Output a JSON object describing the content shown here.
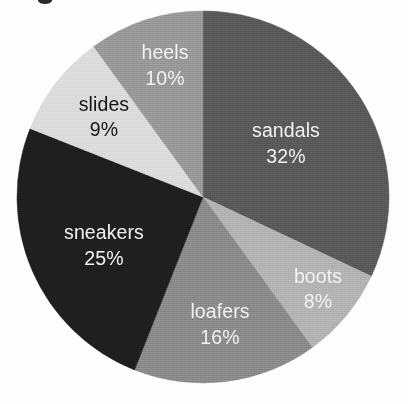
{
  "chart_data": {
    "type": "pie",
    "title": "",
    "subtitle": "",
    "xlabel": "",
    "ylabel": "",
    "legend_position": "none",
    "grid": false,
    "labels_inside_slices": true,
    "value_format": "percent",
    "total": 100,
    "categories": [
      "sandals",
      "boots",
      "loafers",
      "sneakers",
      "slides",
      "heels"
    ],
    "values": [
      32,
      8,
      16,
      25,
      9,
      10
    ],
    "value_labels": [
      "32%",
      "8%",
      "16%",
      "25%",
      "9%",
      "10%"
    ],
    "start_angle_deg": 0,
    "direction": "clockwise",
    "slices": [
      {
        "name": "sandals",
        "label": "sandals",
        "value": 32,
        "value_label": "32%",
        "color": "#5a5a5a",
        "text_color": "#f2f2f2",
        "start_deg": 0,
        "end_deg": 115.2,
        "label_x": 286,
        "label_y": 132,
        "value_x": 286,
        "value_y": 158
      },
      {
        "name": "boots",
        "label": "boots",
        "value": 8,
        "value_label": "8%",
        "color": "#b4b4b4",
        "text_color": "#f2f2f2",
        "start_deg": 115.2,
        "end_deg": 144.0,
        "label_x": 318,
        "label_y": 278,
        "value_x": 318,
        "value_y": 303
      },
      {
        "name": "loafers",
        "label": "loafers",
        "value": 16,
        "value_label": "16%",
        "color": "#8c8c8c",
        "text_color": "#f2f2f2",
        "start_deg": 144.0,
        "end_deg": 201.6,
        "label_x": 220,
        "label_y": 313,
        "value_x": 220,
        "value_y": 339
      },
      {
        "name": "sneakers",
        "label": "sneakers",
        "value": 25,
        "value_label": "25%",
        "color": "#1f1f1f",
        "text_color": "#f2f2f2",
        "start_deg": 201.6,
        "end_deg": 291.6,
        "label_x": 104,
        "label_y": 234,
        "value_x": 104,
        "value_y": 260
      },
      {
        "name": "slides",
        "label": "slides",
        "value": 9,
        "value_label": "9%",
        "color": "#dcdcdc",
        "text_color": "#151515",
        "start_deg": 291.6,
        "end_deg": 324.0,
        "label_x": 104,
        "label_y": 106,
        "value_x": 104,
        "value_y": 131
      },
      {
        "name": "heels",
        "label": "heels",
        "value": 10,
        "value_label": "10%",
        "color": "#9a9a9a",
        "text_color": "#f2f2f2",
        "start_deg": 324.0,
        "end_deg": 360.0,
        "label_x": 165,
        "label_y": 54,
        "value_x": 165,
        "value_y": 80
      }
    ]
  },
  "geometry": {
    "center_x": 203,
    "center_y": 197,
    "radius": 186
  },
  "background_color": "#ffffff"
}
